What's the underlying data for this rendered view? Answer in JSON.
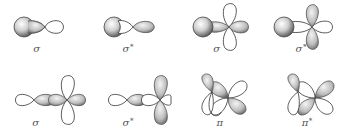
{
  "figure": {
    "colors": {
      "outline": "#333333",
      "shade_light": "#ffffff",
      "shade_mid": "#c8c8c8",
      "shade_dark": "#4a4a4a",
      "label": "#555555"
    },
    "panels": [
      {
        "row": 1,
        "col": 1,
        "symbol": "σ",
        "star": "",
        "overlap": "s + p (head-on, in phase)"
      },
      {
        "row": 1,
        "col": 2,
        "symbol": "σ",
        "star": "*",
        "overlap": "s + p (head-on, out of phase)"
      },
      {
        "row": 1,
        "col": 3,
        "symbol": "σ",
        "star": "",
        "overlap": "s + d (head-on, in phase)"
      },
      {
        "row": 1,
        "col": 4,
        "symbol": "σ",
        "star": "*",
        "overlap": "s + d (head-on, out of phase)"
      },
      {
        "row": 2,
        "col": 1,
        "symbol": "σ",
        "star": "",
        "overlap": "p + d (head-on, in phase)"
      },
      {
        "row": 2,
        "col": 2,
        "symbol": "σ",
        "star": "*",
        "overlap": "p + d (head-on, out of phase)"
      },
      {
        "row": 2,
        "col": 3,
        "symbol": "π",
        "star": "",
        "overlap": "d + d (side-on, in phase)"
      },
      {
        "row": 2,
        "col": 4,
        "symbol": "π",
        "star": "*",
        "overlap": "d + d (side-on, out of phase)"
      }
    ]
  }
}
